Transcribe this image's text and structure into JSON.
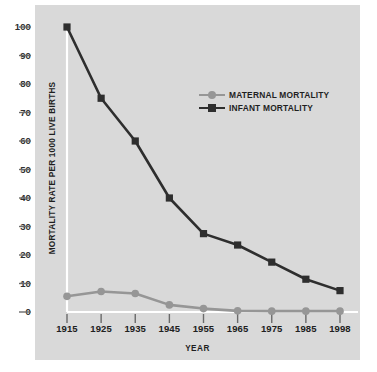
{
  "chart_data": {
    "type": "line",
    "title": "",
    "xlabel": "YEAR",
    "ylabel": "MORTALITY RATE PER 1000 LIVE BIRTHS",
    "categories": [
      "1915",
      "1925",
      "1935",
      "1945",
      "1955",
      "1965",
      "1975",
      "1985",
      "1998"
    ],
    "x": [
      1915,
      1925,
      1935,
      1945,
      1955,
      1965,
      1975,
      1985,
      1998
    ],
    "series": [
      {
        "name": "MATERNAL MORTALITY",
        "color": "#969696",
        "marker": "circle",
        "values": [
          5.5,
          7.2,
          6.5,
          2.5,
          1.2,
          0.4,
          0.3,
          0.3,
          0.3
        ]
      },
      {
        "name": "INFANT MORTALITY",
        "color": "#2e2e2e",
        "marker": "square",
        "values": [
          100,
          75,
          60,
          40,
          27.5,
          23.5,
          17.5,
          11.5,
          7.5
        ]
      }
    ],
    "ylim": [
      0,
      100
    ],
    "ytick_values": [
      0,
      10,
      20,
      30,
      40,
      50,
      60,
      70,
      80,
      90,
      100
    ],
    "ytick_labels": [
      "0",
      "10",
      "20",
      "30",
      "40",
      "50",
      "60",
      "70",
      "80",
      "90",
      "100"
    ],
    "grid": false,
    "legend_position": "upper-right-inside",
    "panel_background": "#d9d9d9",
    "page_background": "#ffffff",
    "guide_line_color": "#ffffff"
  },
  "legend": {
    "items": [
      {
        "label": "MATERNAL MORTALITY",
        "marker_icon": "circle-marker-icon"
      },
      {
        "label": "INFANT MORTALITY",
        "marker_icon": "square-marker-icon"
      }
    ]
  }
}
